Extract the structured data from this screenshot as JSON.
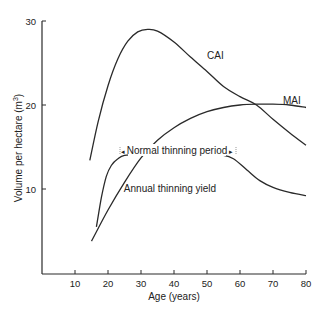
{
  "chart_data": {
    "type": "line",
    "title": "",
    "xlabel": "Age (years)",
    "ylabel": "Volume per hectare (m³)",
    "xlim": [
      0,
      80
    ],
    "ylim": [
      0,
      30
    ],
    "xticks": [
      10,
      20,
      30,
      40,
      50,
      60,
      70,
      80
    ],
    "yticks": [
      10,
      20,
      30
    ],
    "grid": false,
    "legend": "none (inline curve labels)",
    "series": [
      {
        "name": "CAI",
        "x": [
          14.5,
          17,
          20,
          23,
          26,
          29,
          32,
          35,
          40,
          45,
          50,
          55,
          60,
          65,
          70,
          75,
          80
        ],
        "y": [
          13.4,
          18.0,
          22.3,
          25.5,
          27.6,
          28.7,
          29.0,
          28.8,
          27.5,
          25.7,
          24.0,
          22.2,
          21.0,
          20.0,
          18.3,
          16.7,
          15.2
        ]
      },
      {
        "name": "MAI",
        "x": [
          15,
          20,
          25,
          30,
          35,
          40,
          45,
          50,
          55,
          60,
          65,
          70,
          75,
          80
        ],
        "y": [
          3.8,
          7.5,
          10.8,
          13.7,
          15.8,
          17.3,
          18.4,
          19.2,
          19.7,
          20.0,
          20.1,
          20.1,
          20.0,
          19.7
        ]
      },
      {
        "name": "Annual thinning yield",
        "x": [
          16.5,
          18,
          19.5,
          21,
          23,
          25,
          30,
          40,
          50,
          55,
          58,
          62,
          66,
          70,
          75,
          80
        ],
        "y": [
          5.5,
          9.0,
          11.5,
          12.8,
          13.6,
          14.0,
          14.1,
          14.1,
          14.1,
          14.0,
          13.6,
          12.3,
          11.0,
          10.2,
          9.6,
          9.2
        ]
      }
    ],
    "annotations": [
      {
        "text": "CAI",
        "x": 46,
        "y": 25.5
      },
      {
        "text": "MAI",
        "x": 70,
        "y": 20.4
      },
      {
        "text": "Normal thinning period",
        "x_range": [
          25,
          57
        ],
        "y": 15.1,
        "style": "double-arrow span"
      },
      {
        "text": "Annual thinning yield",
        "x": 50,
        "y": 10.7
      }
    ]
  },
  "labels": {
    "xlabel": "Age (years)",
    "ylabel": "Volume per hectare (m",
    "ylabel_sup": "3",
    "ylabel_end": ")",
    "cai": "CAI",
    "mai": "MAI",
    "thinning_period": "Normal thinning period",
    "thinning_yield": "Annual thinning yield",
    "xticks": [
      "10",
      "20",
      "30",
      "40",
      "50",
      "60",
      "70",
      "80"
    ],
    "yticks": [
      "10",
      "20",
      "30"
    ]
  },
  "colors": {
    "line": "#2a2a2a",
    "axis": "#2a2a2a",
    "background": "#ffffff"
  }
}
